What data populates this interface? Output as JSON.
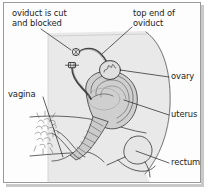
{
  "figure": {
    "border_color": "#9a9a9a",
    "background_color": "#fdfdfd",
    "line_color": "#3a3a3a",
    "body_fill_color": "#e8e8e8",
    "organ_fill_color": "#d6d6d6",
    "text_color": "#1c1c1c"
  },
  "labels": {
    "oviduct_cut": "oviduct is cut\nand blocked",
    "top_end_of_oviduct": "top end of\noviduct",
    "ovary": "ovary",
    "uterus": "uterus",
    "vagina": "vagina",
    "rectum": "rectum"
  },
  "parts": [
    {
      "id": "oviduct",
      "label": "oviduct is cut and blocked",
      "marker": "two surgical clips on severed tube ends"
    },
    {
      "id": "top-end-of-oviduct",
      "label": "top end of oviduct",
      "marker": "free fimbrial end near ovary"
    },
    {
      "id": "ovary",
      "label": "ovary",
      "marker": "oval body with internal follicle squiggle"
    },
    {
      "id": "uterus",
      "label": "uterus",
      "marker": "pear-shaped muscular organ with cavity lining"
    },
    {
      "id": "vagina",
      "label": "vagina",
      "marker": "canal below cervix, pubic region hatching"
    },
    {
      "id": "rectum",
      "label": "rectum",
      "marker": "posterior canal behind uterus"
    }
  ]
}
